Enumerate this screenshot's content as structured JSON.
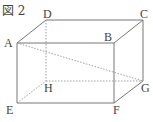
{
  "figure": {
    "title": "図 2",
    "vertices": {
      "A": {
        "label": "A",
        "x": 17,
        "y": 43
      },
      "B": {
        "label": "B",
        "x": 114,
        "y": 43
      },
      "C": {
        "label": "C",
        "x": 143,
        "y": 20
      },
      "D": {
        "label": "D",
        "x": 46,
        "y": 20
      },
      "E": {
        "label": "E",
        "x": 17,
        "y": 103
      },
      "F": {
        "label": "F",
        "x": 114,
        "y": 103
      },
      "G": {
        "label": "G",
        "x": 143,
        "y": 81
      },
      "H": {
        "label": "H",
        "x": 46,
        "y": 81
      }
    },
    "solid_edges": [
      "AB",
      "BC",
      "CD",
      "DA",
      "AE",
      "BF",
      "CG",
      "EF",
      "FG"
    ],
    "hidden_edges": [
      "DH",
      "EH",
      "HG"
    ],
    "diagonal": "AG",
    "colors": {
      "line": "#777777",
      "text": "#444444"
    }
  }
}
